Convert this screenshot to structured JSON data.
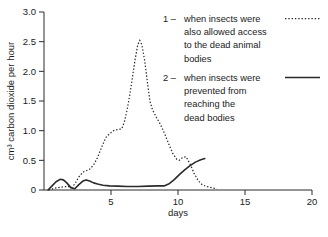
{
  "chart_data": {
    "type": "line",
    "title": "",
    "xlabel": "days",
    "ylabel": "cm³ carbon dioxide per hour",
    "xlim": [
      0,
      20
    ],
    "ylim": [
      0,
      3.0
    ],
    "grid": false,
    "legend_position": "top-right",
    "xticks": [
      0,
      5,
      10,
      15,
      20
    ],
    "xtick_labels": [
      "",
      "5",
      "10",
      "15",
      "20"
    ],
    "yticks": [
      0,
      0.5,
      1.0,
      1.5,
      2.0,
      2.5,
      3.0
    ],
    "ytick_labels": [
      "0",
      "0.5",
      "1.0",
      "1.5",
      "2.0",
      "2.5",
      "3.0"
    ],
    "series": [
      {
        "name": "1",
        "style": "dotted",
        "label": "when insects were also allowed access to the dead animal bodies",
        "x": [
          0.35,
          0.8,
          1.3,
          1.8,
          2.05,
          2.3,
          2.6,
          2.9,
          3.1,
          3.4,
          3.7,
          4.0,
          4.3,
          4.6,
          4.9,
          5.2,
          5.5,
          5.8,
          6.0,
          6.2,
          6.4,
          6.6,
          6.8,
          7.0,
          7.15,
          7.3,
          7.5,
          7.7,
          7.9,
          8.1,
          8.4,
          8.7,
          9.0,
          9.3,
          9.6,
          9.9,
          10.1,
          10.35,
          10.6,
          10.9,
          11.2,
          11.5,
          11.8,
          12.1,
          12.5,
          12.9
        ],
        "y": [
          0.0,
          0.03,
          0.05,
          0.06,
          0.04,
          0.1,
          0.22,
          0.3,
          0.32,
          0.35,
          0.42,
          0.55,
          0.72,
          0.88,
          0.95,
          1.0,
          1.02,
          1.03,
          1.15,
          1.35,
          1.6,
          1.9,
          2.2,
          2.45,
          2.52,
          2.45,
          2.2,
          1.85,
          1.5,
          1.35,
          1.22,
          1.1,
          0.95,
          0.78,
          0.62,
          0.52,
          0.5,
          0.55,
          0.56,
          0.44,
          0.28,
          0.16,
          0.09,
          0.06,
          0.04,
          0.02
        ]
      },
      {
        "name": "2",
        "style": "solid",
        "label": "when insects were prevented from reaching the dead bodies",
        "x": [
          0.3,
          0.6,
          0.9,
          1.2,
          1.45,
          1.7,
          2.0,
          2.3,
          2.6,
          2.9,
          3.15,
          3.4,
          3.7,
          4.0,
          4.4,
          4.9,
          5.5,
          6.2,
          7.0,
          7.8,
          8.5,
          9.0,
          9.3,
          9.7,
          10.1,
          10.5,
          10.9,
          11.3,
          11.7,
          12.0
        ],
        "y": [
          0.0,
          0.07,
          0.14,
          0.18,
          0.17,
          0.12,
          0.04,
          0.02,
          0.09,
          0.15,
          0.17,
          0.15,
          0.12,
          0.1,
          0.08,
          0.07,
          0.065,
          0.06,
          0.06,
          0.065,
          0.07,
          0.07,
          0.1,
          0.17,
          0.26,
          0.34,
          0.41,
          0.47,
          0.51,
          0.53
        ]
      }
    ],
    "legend": [
      {
        "marker": "1",
        "dash": " – ",
        "lines": [
          "when insects were",
          "also allowed access",
          "to the dead animal",
          "bodies"
        ],
        "sample": "dotted-line-sample"
      },
      {
        "marker": "2",
        "dash": " – ",
        "lines": [
          "when insects were",
          "prevented from",
          "reaching the",
          "dead bodies"
        ],
        "sample": "solid-line-sample"
      }
    ],
    "colors": {
      "line": "#2b2b2b",
      "axis": "#2b2b2b",
      "background": "#ffffff",
      "text": "#1a1a1a"
    }
  }
}
